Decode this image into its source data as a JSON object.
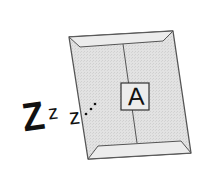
{
  "illustration": {
    "subject": "sleeping-envelope",
    "envelope": {
      "label": "A",
      "fill_color": "#dcdcdc",
      "flap_color": "#e6e6e6",
      "stroke_color": "#555555"
    },
    "sleep_text": {
      "big_z": "Z",
      "mid_z": "z",
      "small_z": "z",
      "color": "#111111"
    }
  }
}
